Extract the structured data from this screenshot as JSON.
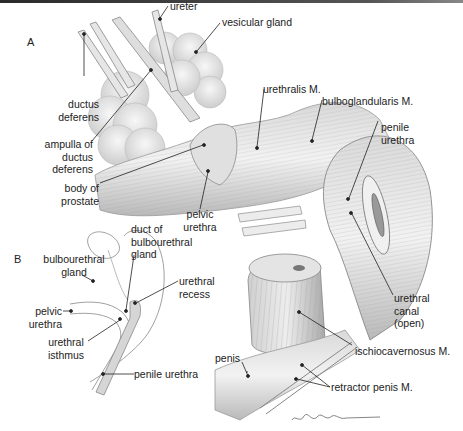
{
  "figure": {
    "panels": [
      {
        "id": "A",
        "label": "A"
      },
      {
        "id": "B",
        "label": "B"
      }
    ],
    "labels_a": {
      "ureter": "ureter",
      "vesicular_gland": "vesicular gland",
      "ductus_deferens_1": "ductus",
      "ductus_deferens_2": "deferens",
      "ampulla_1": "ampulla of",
      "ampulla_2": "ductus",
      "ampulla_3": "deferens",
      "body_prostate_1": "body of",
      "body_prostate_2": "prostate",
      "urethralis": "urethralis M.",
      "bulboglandularis": "bulboglandularis M.",
      "penile_urethra_1": "penile",
      "penile_urethra_2": "urethra",
      "pelvic_urethra_1": "pelvic",
      "pelvic_urethra_2": "urethra",
      "urethral_canal_1": "urethral",
      "urethral_canal_2": "canal",
      "urethral_canal_3": "(open)",
      "ischiocavernosus": "ischiocavernosus M.",
      "penis": "penis",
      "retractor_penis": "retractor penis M."
    },
    "labels_b": {
      "bulbourethral_gland_1": "bulbourethral",
      "bulbourethral_gland_2": "gland",
      "duct_1": "duct of",
      "duct_2": "bulbourethral",
      "duct_3": "gland",
      "urethral_recess_1": "urethral",
      "urethral_recess_2": "recess",
      "pelvic_urethra_1": "pelvic",
      "pelvic_urethra_2": "urethra",
      "isthmus_1": "urethral",
      "isthmus_2": "isthmus",
      "penile_urethra": "penile urethra"
    },
    "signature": "artist signature",
    "colors": {
      "ink": "#222222",
      "shade_dark": "#8a8a8a",
      "shade_mid": "#c4c4c4",
      "shade_light": "#e8e8e8",
      "background": "#ffffff"
    }
  }
}
